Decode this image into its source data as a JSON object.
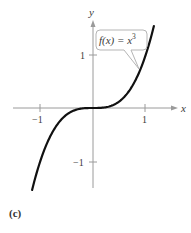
{
  "chart_data": {
    "type": "line",
    "title": "",
    "function_label": "f(x) = x³",
    "xlabel": "x",
    "ylabel": "y",
    "xlim": [
      -1.5,
      1.6
    ],
    "ylim": [
      -1.5,
      1.7
    ],
    "x_ticks": [
      -1,
      1
    ],
    "y_ticks": [
      -1,
      1
    ],
    "x_tick_labels": [
      "−1",
      "1"
    ],
    "y_tick_labels": [
      "−1",
      "1"
    ],
    "grid": false,
    "series": [
      {
        "name": "f(x) = x^3",
        "x": [
          -1.16,
          -1.0,
          -0.8,
          -0.6,
          -0.4,
          -0.2,
          0,
          0.2,
          0.4,
          0.6,
          0.8,
          1.0,
          1.16
        ],
        "y": [
          -1.56,
          -1.0,
          -0.512,
          -0.216,
          -0.064,
          -0.008,
          0,
          0.008,
          0.064,
          0.216,
          0.512,
          1.0,
          1.56
        ]
      }
    ],
    "annotation": {
      "text": "f(x) = x³",
      "points_to": [
        0.9,
        0.73
      ]
    },
    "panel_label": "(c)"
  },
  "labels": {
    "x_axis": "x",
    "y_axis": "y",
    "x_tick_neg1": "−1",
    "x_tick_1": "1",
    "y_tick_1": "1",
    "y_tick_neg1": "−1",
    "callout_fx": "f(x) = x",
    "callout_exp": "3",
    "caption": "(c)"
  }
}
